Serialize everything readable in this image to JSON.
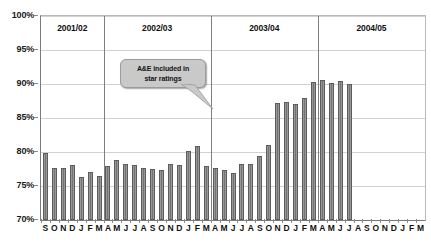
{
  "chart_data": {
    "type": "bar",
    "title": "",
    "xlabel": "",
    "ylabel": "",
    "ylim": [
      70,
      100
    ],
    "ytick_values": [
      70,
      75,
      80,
      85,
      90,
      95,
      100
    ],
    "ytick_labels": [
      "70%",
      "75%",
      "80%",
      "85%",
      "90%",
      "95%",
      "100%"
    ],
    "grid": true,
    "legend": "none",
    "categories": [
      "S",
      "O",
      "N",
      "D",
      "J",
      "F",
      "M",
      "A",
      "M",
      "J",
      "J",
      "A",
      "S",
      "O",
      "N",
      "D",
      "J",
      "F",
      "M",
      "A",
      "M",
      "J",
      "J",
      "A",
      "S",
      "O",
      "N",
      "D",
      "J",
      "F",
      "M",
      "A",
      "M",
      "J",
      "J",
      "A",
      "S",
      "O",
      "N",
      "D",
      "J",
      "F",
      "M"
    ],
    "values": [
      79.9,
      77.6,
      77.7,
      78.1,
      76.3,
      77.1,
      76.5,
      78.0,
      78.8,
      78.2,
      78.1,
      77.7,
      77.5,
      77.3,
      78.2,
      78.1,
      80.2,
      80.9,
      77.9,
      77.6,
      77.4,
      76.9,
      78.2,
      78.2,
      79.4,
      81.1,
      87.2,
      87.3,
      87.0,
      88.0,
      90.3,
      90.6,
      90.2,
      90.4,
      90.0,
      null,
      null,
      null,
      null,
      null,
      null,
      null,
      null
    ],
    "bar_count_drawn": 35,
    "annotations": [
      {
        "name": "star-ratings-callout",
        "text_line1": "A&E included in",
        "text_line2": "star ratings",
        "points_to_index": 26
      }
    ],
    "year_bands": [
      {
        "label": "2001/02",
        "start_index": 0,
        "end_index": 6
      },
      {
        "label": "2002/03",
        "start_index": 7,
        "end_index": 18
      },
      {
        "label": "2003/04",
        "start_index": 19,
        "end_index": 30
      },
      {
        "label": "2004/05",
        "start_index": 31,
        "end_index": 42
      }
    ],
    "bar_color": "#7a7a7a",
    "grid_color": "#d2d2d2",
    "axis_color": "#7a7a7a",
    "callout_color": "#c9c9c9"
  }
}
